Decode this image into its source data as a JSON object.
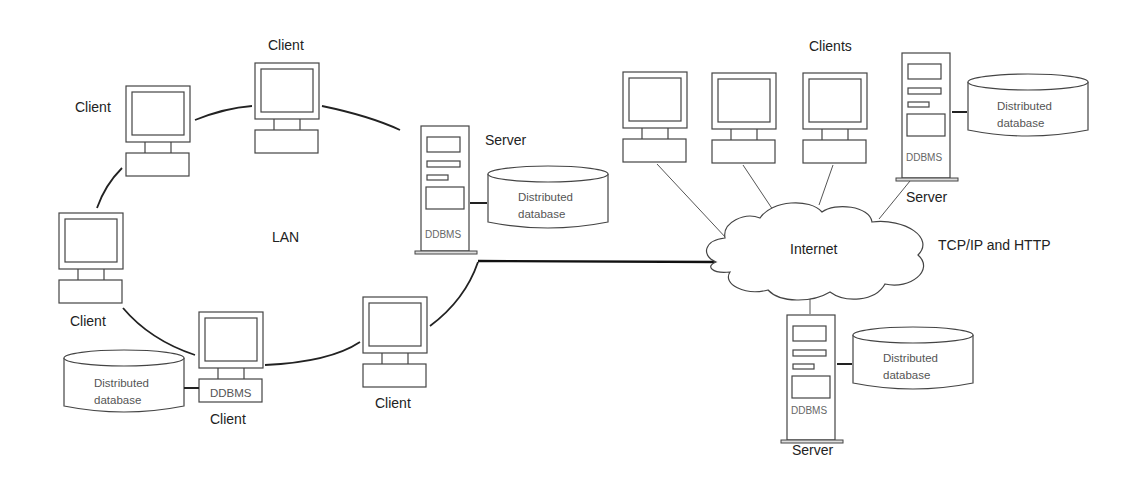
{
  "diagram": {
    "lan": {
      "label": "LAN",
      "clients": [
        {
          "label": "Client"
        },
        {
          "label": "Client"
        },
        {
          "label": "Client"
        },
        {
          "label": "Client"
        },
        {
          "label": "Client",
          "software": "DDBMS"
        }
      ],
      "server": {
        "label": "Server",
        "software": "DDBMS"
      },
      "databases": [
        {
          "line1": "Distributed",
          "line2": "database"
        },
        {
          "line1": "Distributed",
          "line2": "database"
        }
      ]
    },
    "internet": {
      "label": "Internet",
      "protocol_label": "TCP/IP and HTTP",
      "clients_label": "Clients",
      "servers": [
        {
          "label": "Server",
          "software": "DDBMS"
        },
        {
          "label": "Server",
          "software": "DDBMS"
        }
      ],
      "databases": [
        {
          "line1": "Distributed",
          "line2": "database"
        },
        {
          "line1": "Distributed",
          "line2": "database"
        }
      ]
    },
    "colors": {
      "line": "#222222",
      "background": "#ffffff"
    }
  }
}
